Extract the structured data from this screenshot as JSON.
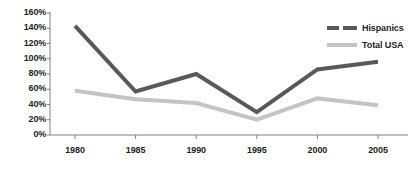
{
  "chart_data": {
    "type": "line",
    "title": "",
    "subtitle": "",
    "xlabel": "",
    "ylabel": "",
    "categories": [
      "1980",
      "1985",
      "1990",
      "1995",
      "2000",
      "2005"
    ],
    "x": [
      1980,
      1985,
      1990,
      1995,
      2000,
      2005
    ],
    "series": [
      {
        "name": "Hispanics",
        "color": "#595959",
        "style": "solid",
        "legend_style": "dashed",
        "line_width": 4,
        "values": [
          143,
          57,
          80,
          30,
          86,
          96
        ]
      },
      {
        "name": "Total USA",
        "color": "#c4c4c4",
        "style": "solid",
        "legend_style": "solid",
        "line_width": 4,
        "values": [
          58,
          47,
          42,
          20,
          48,
          39
        ]
      }
    ],
    "ylim": [
      0,
      160
    ],
    "ytick_values": [
      0,
      20,
      40,
      60,
      80,
      100,
      120,
      140,
      160
    ],
    "ytick_labels": [
      "0%",
      "20%",
      "40%",
      "60%",
      "80%",
      "100%",
      "120%",
      "140%",
      "160%"
    ],
    "xtick_labels": [
      "1980",
      "1985",
      "1990",
      "1995",
      "2000",
      "2005"
    ],
    "grid": false,
    "legend_position": "top-right",
    "axis_color": "#808080"
  },
  "legend": {
    "entries": [
      {
        "label": "Hispanics"
      },
      {
        "label": "Total USA"
      }
    ]
  },
  "colors": {
    "hispanics": "#595959",
    "total_usa": "#c4c4c4",
    "axis": "#808080",
    "text": "#231f20",
    "background": "#ffffff"
  }
}
